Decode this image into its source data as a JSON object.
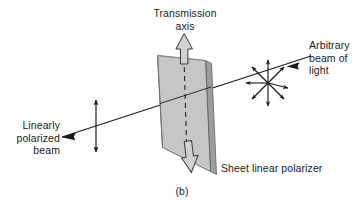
{
  "figure": {
    "caption": "(b)",
    "background_color": "#ffffff",
    "ink_color": "#1a1a1a",
    "sheet_fill_color": "#c8c8c8",
    "sheet_edge_color": "#b0b0b0",
    "arrow_fill_color": "#d4d4d4"
  },
  "labels": {
    "transmission_axis": "Transmission\naxis",
    "arbitrary_beam": "Arbitrary\nbeam of\nlight",
    "linearly_polarized": "Linearly\npolarized\nbeam",
    "sheet_polarizer": "Sheet linear polarizer"
  },
  "elements": {
    "polarizer_sheet_name": "sheet linear polarizer",
    "transmission_axis_arrow_up": "transmission axis up arrow",
    "transmission_axis_arrow_down": "transmission axis down arrow",
    "transmission_axis_dashed_line": "transmission axis dashed line",
    "incident_beam_line": "arbitrary beam of light ray",
    "outgoing_beam_line": "linearly polarized beam ray",
    "unpolarized_starburst": "unpolarized oscillation starburst",
    "polarized_double_arrow": "vertical polarization double arrow"
  }
}
